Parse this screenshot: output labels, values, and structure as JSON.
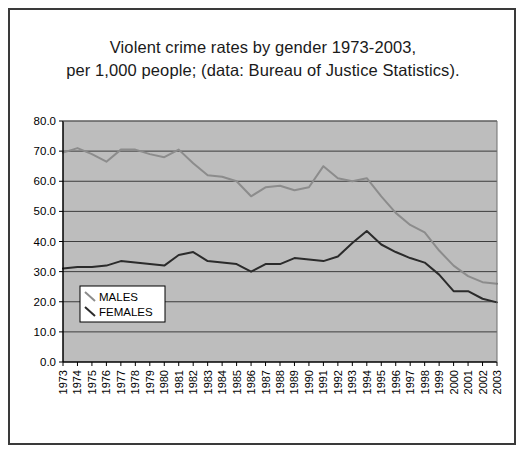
{
  "frame": {
    "border_color": "#3a3a3a",
    "background": "#ffffff"
  },
  "title": {
    "line1": "Violent crime rates by gender 1973-2003,",
    "line2": "per 1,000 people; (data: Bureau of Justice Statistics)."
  },
  "legend": {
    "items": [
      {
        "label": "MALES",
        "color": "#8c8c8c"
      },
      {
        "label": "FEMALES",
        "color": "#2b2b2b"
      }
    ]
  },
  "chart_data": {
    "type": "line",
    "title": "Violent crime rates by gender 1973-2003, per 1,000 people; (data: Bureau of Justice Statistics).",
    "xlabel": "",
    "ylabel": "",
    "grid": true,
    "legend_position": "inside-lower-left",
    "plot_background": "#bdbdbd",
    "ylim": [
      0,
      80
    ],
    "ytick_step": 10,
    "ytick_labels": [
      "0.0",
      "10.0",
      "20.0",
      "30.0",
      "40.0",
      "50.0",
      "60.0",
      "70.0",
      "80.0"
    ],
    "categories": [
      "1973",
      "1974",
      "1975",
      "1976",
      "1977",
      "1978",
      "1979",
      "1980",
      "1981",
      "1982",
      "1983",
      "1984",
      "1985",
      "1986",
      "1987",
      "1988",
      "1989",
      "1990",
      "1991",
      "1992",
      "1993",
      "1994",
      "1995",
      "1996",
      "1997",
      "1998",
      "1999",
      "2000",
      "2001",
      "2002",
      "2003"
    ],
    "series": [
      {
        "name": "MALES",
        "color": "#8c8c8c",
        "values": [
          69.5,
          71.0,
          69.0,
          66.5,
          70.5,
          70.5,
          69.0,
          68.0,
          70.5,
          66.0,
          62.0,
          61.5,
          60.0,
          55.0,
          58.0,
          58.5,
          57.0,
          58.0,
          65.0,
          61.0,
          60.0,
          61.0,
          55.0,
          49.5,
          45.5,
          43.0,
          37.0,
          32.0,
          28.5,
          26.5,
          26.0
        ]
      },
      {
        "name": "FEMALES",
        "color": "#2b2b2b",
        "values": [
          31.0,
          31.5,
          31.5,
          32.0,
          33.5,
          33.0,
          32.5,
          32.0,
          35.5,
          36.5,
          33.5,
          33.0,
          32.5,
          30.0,
          32.5,
          32.5,
          34.5,
          34.0,
          33.5,
          35.0,
          39.5,
          43.5,
          39.0,
          36.5,
          34.5,
          33.0,
          29.0,
          23.5,
          23.5,
          21.0,
          19.8
        ]
      }
    ]
  }
}
